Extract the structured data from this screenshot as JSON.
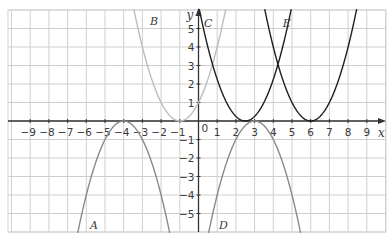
{
  "chart_data": {
    "type": "line",
    "title": "",
    "xlabel": "x",
    "ylabel": "y",
    "xlim": [
      -10,
      10
    ],
    "ylim": [
      -6,
      6
    ],
    "grid": true,
    "origin_label": "0",
    "x_ticks": [
      -9,
      -8,
      -7,
      -6,
      -5,
      -4,
      -3,
      -2,
      -1,
      1,
      2,
      3,
      4,
      5,
      6,
      7,
      8,
      9
    ],
    "y_ticks": [
      -5,
      -4,
      -3,
      -2,
      -1,
      1,
      2,
      3,
      4,
      5
    ],
    "series": [
      {
        "name": "A",
        "equation": "y = -(x+4)^2",
        "vertex": [
          -4,
          0
        ],
        "opens": "down",
        "color": "#8a8a8a",
        "label_pos": [
          -5.8,
          -5.6
        ]
      },
      {
        "name": "B",
        "equation": "y = (x+1)^2",
        "vertex": [
          -1,
          0
        ],
        "opens": "up",
        "color": "#bdbdbd",
        "label_pos": [
          -2.6,
          5.4
        ]
      },
      {
        "name": "C",
        "equation": "y = (x-2.5)^2",
        "vertex": [
          2.5,
          0
        ],
        "opens": "up",
        "color": "#1f1f1f",
        "label_pos": [
          0.3,
          5.3
        ]
      },
      {
        "name": "D",
        "equation": "y = -(x-3)^2",
        "vertex": [
          3,
          0
        ],
        "opens": "down",
        "color": "#8a8a8a",
        "label_pos": [
          1.1,
          -5.6
        ]
      },
      {
        "name": "E",
        "equation": "y = (x-6)^2",
        "vertex": [
          6,
          0
        ],
        "opens": "up",
        "color": "#1f1f1f",
        "label_pos": [
          4.5,
          5.3
        ]
      }
    ]
  }
}
